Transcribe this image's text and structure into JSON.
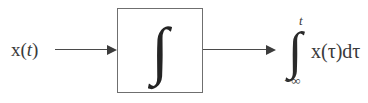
{
  "diagram": {
    "background_color": "#ffffff",
    "line_color": "#4a4a4a",
    "text_color": "#3a3a3a",
    "border_color": "#6f6f6f"
  },
  "input": {
    "label_function": "x",
    "label_open_paren": "(",
    "label_variable": "t",
    "label_close_paren": ")",
    "full_label": "x(t)"
  },
  "block": {
    "symbol": "∫",
    "symbol_name": "integral-sign",
    "operation": "integration"
  },
  "arrows": {
    "input_arrow_name": "input-signal-arrow",
    "output_arrow_name": "output-signal-arrow",
    "head_glyph": "▶"
  },
  "output": {
    "integral_sign": "∫",
    "upper_limit": "t",
    "lower_limit": "−∞",
    "integrand": "x(τ)dτ",
    "full_expression": "∫ from −∞ to t of x(τ)dτ"
  }
}
